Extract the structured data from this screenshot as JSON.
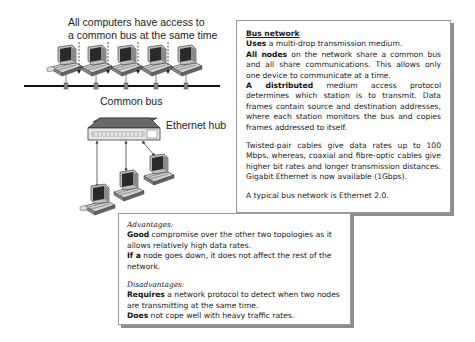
{
  "diagram": {
    "top_caption_line1": "All computers have access to",
    "top_caption_line2": "a common bus at the same time",
    "bus_label": "Common bus",
    "hub_label": "Ethernet hub",
    "bus_computers": 5,
    "hub_computers": 3
  },
  "bus_box": {
    "title": "Bus network",
    "p1_bold": "Uses",
    "p1_rest": " a multi-drop transmission medium.",
    "p2_bold": "All nodes",
    "p2_rest": " on the network share a common bus and all share communications. This allows only one device to communicate at a time.",
    "p3_bold": "A distributed",
    "p3_rest": " medium access protocol determines which station is to transmit. Data frames contain source and destination addresses, where each station monitors the bus and copies frames addressed to itself.",
    "p4": "Twisted-pair cables give data rates up to 100 Mbps, whereas, coaxial and fibre-optic cables give higher bit rates and longer transmission distances.  Gigabit Ethernet is now available (1Gbps).",
    "p5": "A typical bus network is Ethernet 2.0."
  },
  "pros_box": {
    "advantages_heading": "Advantages:",
    "adv1_bold": "Good",
    "adv1_rest": " compromise over the other two topologies as it allows relatively high data rates.",
    "adv2_bold": "If a",
    "adv2_rest": " node goes down, it does not affect the rest of the network.",
    "disadvantages_heading": "Disadvantages:",
    "dis1_bold": "Requires",
    "dis1_rest": " a network protocol to detect when two nodes are transmitting at the same time.",
    "dis2_bold": "Does",
    "dis2_rest": " not cope well with heavy traffic rates."
  },
  "colors": {
    "box_border": "#9a9a9a",
    "box_shadow": "#8d8d8d",
    "bus_line": "#111111"
  }
}
